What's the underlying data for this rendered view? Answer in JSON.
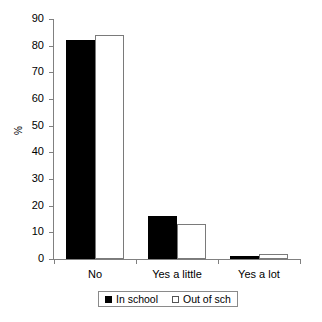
{
  "chart_data": {
    "type": "bar",
    "title": "",
    "subtitle": "",
    "xlabel": "",
    "ylabel": "%",
    "categories": [
      "No",
      "Yes a little",
      "Yes a lot"
    ],
    "series": [
      {
        "name": "In school",
        "values": [
          82,
          16,
          1
        ],
        "color": "#000000",
        "style": "filled"
      },
      {
        "name": "Out of sch",
        "values": [
          84,
          13,
          2
        ],
        "color": "#ffffff",
        "style": "open"
      }
    ],
    "ylim": [
      0,
      90
    ],
    "ytick_step": 10,
    "yticks": [
      0,
      10,
      20,
      30,
      40,
      50,
      60,
      70,
      80,
      90
    ],
    "ytick_labels": [
      "0",
      "10",
      "20",
      "30",
      "40",
      "50",
      "60",
      "70",
      "80",
      "90"
    ],
    "grid": false,
    "legend_position": "bottom",
    "legend_entries": [
      "In school",
      "Out of sch"
    ]
  }
}
